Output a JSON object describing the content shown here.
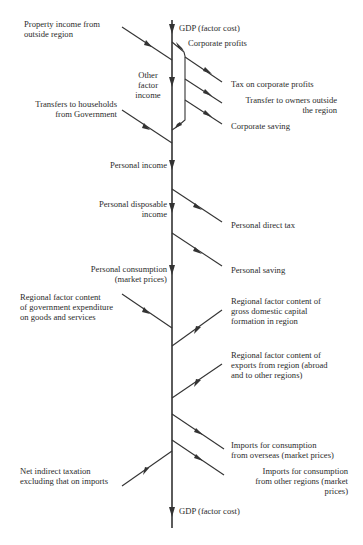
{
  "diagram": {
    "type": "flow",
    "main_axis": {
      "top_label": "GDP (factor cost)",
      "bottom_label": "GDP (factor cost)"
    },
    "nodes": {
      "corporate_profits": "Corporate profits",
      "other_factor_income": "Other\nfactor\nincome",
      "personal_income": "Personal income",
      "personal_disposable_income": "Personal disposable\nincome",
      "personal_consumption": "Personal consumption\n(market prices)"
    },
    "inflows": {
      "property_income": "Property income from\noutside region",
      "transfers_households": "Transfers to households\nfrom Government",
      "gov_expenditure": "Regional factor content\nof government expenditure\non goods and services",
      "capital_formation": "Regional factor content of\ngross domestic capital\nformation in region",
      "exports": "Regional factor content of\nexports from region (abroad\nand to other regions)"
    },
    "outflows": {
      "tax_corporate": "Tax on corporate profits",
      "transfer_owners": "Transfer to owners outside\nthe region",
      "corporate_saving": "Corporate saving",
      "personal_direct_tax": "Personal direct tax",
      "personal_saving": "Personal saving",
      "imports_overseas": "Imports for consumption\nfrom overseas (market prices)",
      "imports_regions": "Imports for consumption\nfrom other regions (market\nprices)",
      "net_indirect_tax": "Net indirect taxation\nexcluding that on imports"
    }
  }
}
